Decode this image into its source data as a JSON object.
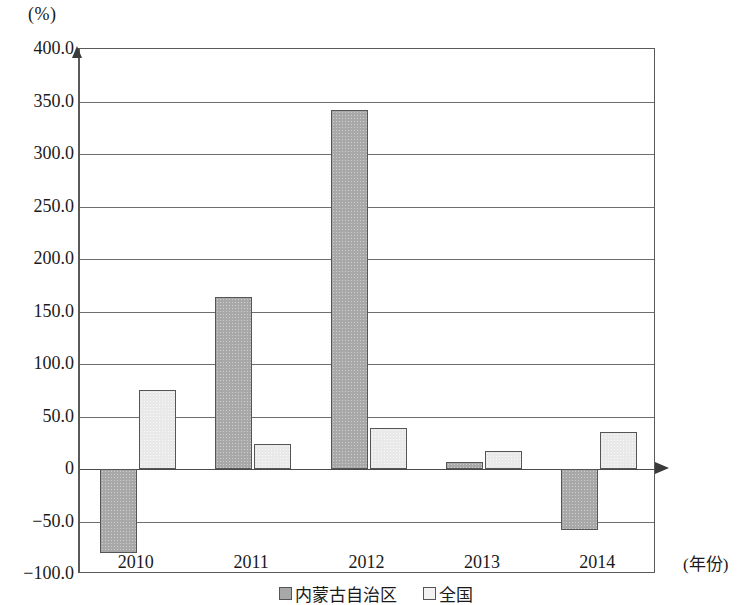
{
  "chart_data": {
    "type": "bar",
    "title": "",
    "xlabel": "(年份)",
    "ylabel": "(%)",
    "categories": [
      "2010",
      "2011",
      "2012",
      "2013",
      "2014"
    ],
    "series": [
      {
        "name": "内蒙古自治区",
        "color": "#a8a8a8",
        "values": [
          -80.0,
          164.0,
          342.0,
          7.0,
          -58.0
        ]
      },
      {
        "name": "全国",
        "color": "#efefef",
        "values": [
          75.0,
          24.0,
          39.0,
          17.0,
          35.0
        ]
      }
    ],
    "ylim": [
      -100.0,
      400.0
    ],
    "y_ticks": [
      "400.0",
      "350.0",
      "300.0",
      "250.0",
      "200.0",
      "150.0",
      "100.0",
      "50.0",
      "0",
      "−50.0",
      "−100.0"
    ],
    "y_tick_values": [
      400.0,
      350.0,
      300.0,
      250.0,
      200.0,
      150.0,
      100.0,
      50.0,
      0,
      -50.0,
      -100.0
    ],
    "grid": true,
    "legend_position": "bottom"
  }
}
